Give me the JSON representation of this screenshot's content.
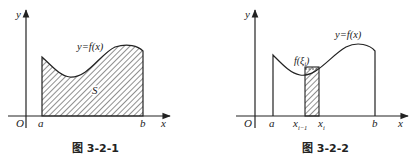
{
  "figures": [
    {
      "id": "fig-3-2-1",
      "caption": "图 3-2-1",
      "origin_label": "O",
      "x_axis_label": "x",
      "y_axis_label": "y",
      "a_label": "a",
      "b_label": "b",
      "curve_label": "y=f(x)",
      "region_label": "S"
    },
    {
      "id": "fig-3-2-2",
      "caption": "图 3-2-2",
      "origin_label": "O",
      "x_axis_label": "x",
      "y_axis_label": "y",
      "a_label": "a",
      "b_label": "b",
      "curve_label": "y=f(x)",
      "xi_minus_label_base": "x",
      "xi_minus_label_sub": "i−1",
      "xi_label_base": "x",
      "xi_label_sub": "i",
      "f_xi_label_prefix": "f(",
      "f_xi_label_var": "ξ",
      "f_xi_label_sub": "i",
      "f_xi_label_suffix": ")"
    }
  ],
  "colors": {
    "ink": "#222222",
    "background": "#ffffff"
  }
}
